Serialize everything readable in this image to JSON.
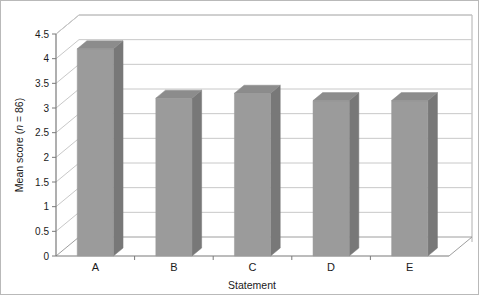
{
  "chart_data": {
    "type": "bar",
    "title": "",
    "subtitle": "",
    "xlabel": "Statement",
    "ylabel": "Mean score (n = 86)",
    "ylabel_prefix": "Mean score (",
    "ylabel_italic": "n",
    "ylabel_suffix": " = 86)",
    "categories": [
      "A",
      "B",
      "C",
      "D",
      "E"
    ],
    "values": [
      4.2,
      3.2,
      3.3,
      3.15,
      3.15
    ],
    "ylim": [
      0,
      4.5
    ],
    "ytick_step": 0.5,
    "ytick_labels": [
      "0",
      "0.5",
      "1",
      "1.5",
      "2",
      "2.5",
      "3",
      "3.5",
      "4",
      "4.5"
    ],
    "ytick_values": [
      0,
      0.5,
      1,
      1.5,
      2,
      2.5,
      3,
      3.5,
      4,
      4.5
    ],
    "grid": true,
    "legend": false,
    "legend_position": "none",
    "style": "3d-column",
    "colors": {
      "bar_front": "#9b9b9b",
      "bar_side": "#787878",
      "bar_top": "#8c8c8c",
      "gridline": "#c8c8c8",
      "axis": "#7a7a7a",
      "background": "#ffffff",
      "border": "#b9b9b9",
      "text": "#1a1a1a"
    }
  }
}
